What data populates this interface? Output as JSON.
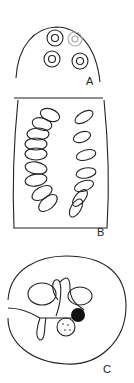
{
  "figure": {
    "panels": [
      {
        "id": "A",
        "label": "A",
        "description": "Anterior end with four rosette-shaped discs"
      },
      {
        "id": "B",
        "label": "B",
        "description": "Segment with two arcs of elongated ovoid bodies"
      },
      {
        "id": "C",
        "label": "C",
        "description": "Round body with two hatched ovals, convoluted tubes, dark sphere and dotted sphere"
      }
    ],
    "colors": {
      "line": "#222222",
      "background": "#ffffff",
      "fill_dark": "#111111"
    }
  }
}
